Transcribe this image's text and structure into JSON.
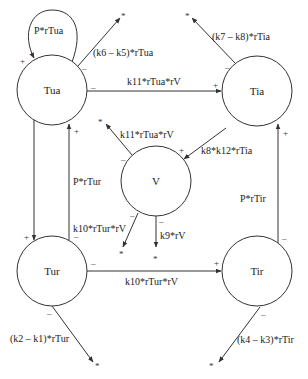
{
  "diagram": {
    "type": "compartment-flow",
    "nodes": [
      {
        "id": "Tua",
        "label": "Tua"
      },
      {
        "id": "Tia",
        "label": "Tia"
      },
      {
        "id": "V",
        "label": "V"
      },
      {
        "id": "Tur",
        "label": "Tur"
      },
      {
        "id": "Tir",
        "label": "Tir"
      }
    ],
    "edges": [
      {
        "from": "Tua",
        "to": "Tua",
        "label": "P*rTua",
        "sign": "+"
      },
      {
        "from": "Tua",
        "to": "sink",
        "label": "(k6 – k5)*rTua",
        "sign": "–"
      },
      {
        "from": "Tua",
        "to": "Tia",
        "label": "k11*rTua*rV",
        "sign_from": "–",
        "sign_to": "+"
      },
      {
        "from": "Tia",
        "to": "sink",
        "label": "(k7 – k8)*rTia",
        "sign": "–"
      },
      {
        "from": "V",
        "to": "sink",
        "label": "k11*rTua*rV",
        "sign": "–"
      },
      {
        "from": "Tia",
        "to": "V",
        "label": "k8*k12*rTia",
        "sign": "+"
      },
      {
        "from": "Tua",
        "to": "Tur",
        "label": "",
        "sign": "+"
      },
      {
        "from": "Tur",
        "to": "Tua",
        "label": "P*rTur",
        "sign_from": "–",
        "sign_to": "+"
      },
      {
        "from": "V",
        "to": "sink",
        "label": "k10*rTur*rV",
        "sign": "–"
      },
      {
        "from": "V",
        "to": "sink",
        "label": "k9*rV",
        "sign": "–"
      },
      {
        "from": "Tur",
        "to": "Tir",
        "label": "k10*rTur*rV",
        "sign_from": "–",
        "sign_to": "+"
      },
      {
        "from": "Tir",
        "to": "Tia",
        "label": "P*rTir",
        "sign_from": "–",
        "sign_to": "+"
      },
      {
        "from": "Tur",
        "to": "sink",
        "label": "(k2 – k1)*rTur",
        "sign": "–"
      },
      {
        "from": "Tir",
        "to": "sink",
        "label": "(k4 – k3)*rTir",
        "sign": "–"
      }
    ],
    "sink_symbol": "*",
    "plus": "+",
    "minus": "–"
  }
}
